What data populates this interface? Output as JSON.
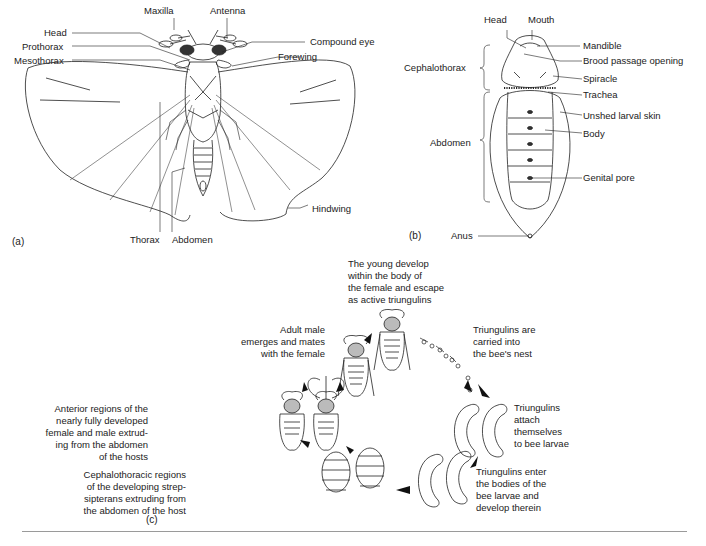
{
  "figure": {
    "panel_a": {
      "label": "(a)",
      "parts": {
        "maxilla": "Maxilla",
        "antenna": "Antenna",
        "head": "Head",
        "prothorax": "Prothorax",
        "mesothorax": "Mesothorax",
        "compound_eye": "Compound eye",
        "forewing": "Forewing",
        "hindwing": "Hindwing",
        "thorax": "Thorax",
        "abdomen": "Abdomen"
      }
    },
    "panel_b": {
      "label": "(b)",
      "parts": {
        "head": "Head",
        "mouth": "Mouth",
        "cephalothorax": "Cephalothorax",
        "abdomen": "Abdomen",
        "mandible": "Mandible",
        "brood_passage_opening": "Brood passage opening",
        "spiracle": "Spiracle",
        "trachea": "Trachea",
        "unshed_larval_skin": "Unshed larval skin",
        "body": "Body",
        "genital_pore": "Genital pore",
        "anus": "Anus"
      }
    },
    "panel_c": {
      "label": "(c)",
      "stages": [
        {
          "id": "young-develop",
          "lines": [
            "The young develop",
            "within the body of",
            "the female and escape",
            "as active triungulins"
          ]
        },
        {
          "id": "triungulins-carried",
          "lines": [
            "Triungulins are",
            "carried into",
            "the bee's nest"
          ]
        },
        {
          "id": "triungulins-attach",
          "lines": [
            "Triungulins",
            "attach",
            "themselves",
            "to bee larvae"
          ]
        },
        {
          "id": "triungulins-enter",
          "lines": [
            "Triungulins enter",
            "the bodies of the",
            "bee larvae and",
            "develop therein"
          ]
        },
        {
          "id": "cephalothoracic",
          "lines": [
            "Cephalothoracic regions",
            "of the developing strep-",
            "sipterans extruding from",
            "the abdomen of the host"
          ]
        },
        {
          "id": "anterior-regions",
          "lines": [
            "Anterior regions of the",
            "nearly fully developed",
            "female and male extrud-",
            "ing from the abdomen",
            "of the hosts"
          ]
        },
        {
          "id": "adult-male",
          "lines": [
            "Adult male",
            "emerges and mates",
            "with the female"
          ]
        }
      ]
    }
  }
}
